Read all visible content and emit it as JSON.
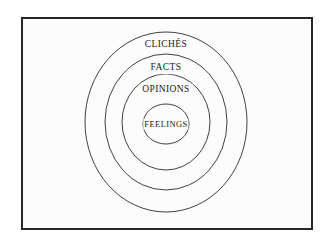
{
  "diagram": {
    "type": "concentric-circles",
    "title": "",
    "background_color": "#ffffff",
    "panel_color": "#fcfcfc",
    "frame": {
      "border_color": "#262626",
      "border_width_px": 2
    },
    "stroke_color": "#2b2b2b",
    "text_color": "#1a1a1a",
    "center": {
      "x": 166,
      "y": 122
    },
    "rings": [
      {
        "label": "CLICHÉS",
        "level": 1,
        "position": "outermost",
        "rx": 81,
        "ry": 90,
        "label_x": 166,
        "label_y": 45
      },
      {
        "label": "FACTS",
        "level": 2,
        "position": "second",
        "rx": 61,
        "ry": 68,
        "label_x": 166,
        "label_y": 68
      },
      {
        "label": "OPINIONS",
        "level": 3,
        "position": "third",
        "rx": 44,
        "ry": 48,
        "label_x": 166,
        "label_y": 90
      },
      {
        "label": "FEELINGS",
        "level": 4,
        "position": "innermost",
        "rx": 23,
        "ry": 20,
        "label_x": 166,
        "label_y": 124
      }
    ]
  }
}
